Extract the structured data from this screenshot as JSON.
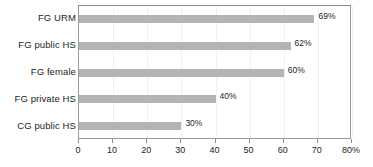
{
  "chart_data": {
    "type": "bar",
    "orientation": "horizontal",
    "title": "",
    "xlabel": "",
    "ylabel": "",
    "categories": [
      "FG URM",
      "FG public HS",
      "FG female",
      "FG private HS",
      "CG public HS"
    ],
    "values": [
      69,
      62,
      60,
      40,
      30
    ],
    "value_labels": [
      "69%",
      "62%",
      "60%",
      "40%",
      "30%"
    ],
    "xlim": [
      0,
      80
    ],
    "xticks": [
      0,
      10,
      20,
      30,
      40,
      50,
      60,
      70,
      80
    ],
    "xtick_labels": [
      "0",
      "10",
      "20",
      "30",
      "40",
      "50",
      "60",
      "70",
      "80%"
    ],
    "grid": "vertical-faint",
    "legend": "none",
    "bar_color": "#b4b4b4",
    "frame_color": "#9a9a9a",
    "text_color": "#231f20"
  }
}
